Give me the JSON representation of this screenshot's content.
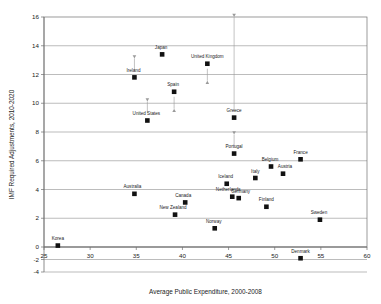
{
  "chart_data": {
    "type": "scatter",
    "title": "",
    "xlabel": "Average Public Expenditure, 2000-2008",
    "ylabel": "IMF Required Adjustments, 2010-2020",
    "xlim": [
      25,
      60
    ],
    "ylim": [
      -4,
      16
    ],
    "xticks": [
      25,
      30,
      35,
      40,
      45,
      50,
      55,
      60
    ],
    "yticks": [
      -4,
      -2,
      0,
      2,
      4,
      6,
      8,
      10,
      12,
      14,
      16
    ],
    "xtick_labels": [
      "25",
      "30",
      "35",
      "40",
      "45",
      "50",
      "55",
      "60"
    ],
    "ytick_labels": [
      "-4",
      "-2",
      "0",
      "2",
      "4",
      "6",
      "8",
      "10",
      "12",
      "14",
      "16"
    ],
    "grid": "horizontal",
    "legend": "none",
    "points": [
      {
        "name": "Korea",
        "x": 26.5,
        "y": 0.1,
        "label_dx": 0,
        "label_dy": -4,
        "arrow": "none"
      },
      {
        "name": "Australia",
        "x": 34.8,
        "y": 3.7,
        "label_dx": -2,
        "label_dy": -4,
        "arrow": "none"
      },
      {
        "name": "Ireland",
        "x": 34.8,
        "y": 11.8,
        "label_dx": -1,
        "label_dy": -4,
        "arrow": "up"
      },
      {
        "name": "United States",
        "x": 36.2,
        "y": 8.8,
        "label_dx": -1,
        "label_dy": -4,
        "arrow": "up"
      },
      {
        "name": "Japan",
        "x": 37.8,
        "y": 13.4,
        "label_dx": -1,
        "label_dy": -4,
        "arrow": "none"
      },
      {
        "name": "Spain",
        "x": 39.1,
        "y": 10.8,
        "label_dx": -1,
        "label_dy": -4,
        "arrow": "down"
      },
      {
        "name": "New Zealand",
        "x": 39.2,
        "y": 2.25,
        "label_dx": -2,
        "label_dy": -4,
        "arrow": "none"
      },
      {
        "name": "Canada",
        "x": 40.3,
        "y": 3.1,
        "label_dx": -2,
        "label_dy": -4,
        "arrow": "none"
      },
      {
        "name": "United Kingdom",
        "x": 42.7,
        "y": 12.75,
        "label_dx": 0,
        "label_dy": -4,
        "arrow": "down"
      },
      {
        "name": "Norway",
        "x": 43.5,
        "y": 1.3,
        "label_dx": -1,
        "label_dy": -4,
        "arrow": "none"
      },
      {
        "name": "Iceland",
        "x": 44.8,
        "y": 4.4,
        "label_dx": -1,
        "label_dy": -4,
        "arrow": "none"
      },
      {
        "name": "Netherlands",
        "x": 45.4,
        "y": 3.5,
        "label_dx": -4,
        "label_dy": -4,
        "arrow": "none"
      },
      {
        "name": "Greece",
        "x": 45.6,
        "y": 9.0,
        "label_dx": 0,
        "label_dy": -4,
        "arrow": "up-long"
      },
      {
        "name": "Portugal",
        "x": 45.6,
        "y": 6.5,
        "label_dx": 0,
        "label_dy": -4,
        "arrow": "up"
      },
      {
        "name": "Germany",
        "x": 46.1,
        "y": 3.4,
        "label_dx": 2,
        "label_dy": -4,
        "arrow": "none"
      },
      {
        "name": "Italy",
        "x": 47.9,
        "y": 4.8,
        "label_dx": 0,
        "label_dy": -4,
        "arrow": "none"
      },
      {
        "name": "Finland",
        "x": 49.1,
        "y": 2.8,
        "label_dx": 0,
        "label_dy": -4,
        "arrow": "none"
      },
      {
        "name": "Belgium",
        "x": 49.6,
        "y": 5.6,
        "label_dx": -1,
        "label_dy": -4,
        "arrow": "none"
      },
      {
        "name": "Austria",
        "x": 50.9,
        "y": 5.1,
        "label_dx": 2,
        "label_dy": -4,
        "arrow": "none"
      },
      {
        "name": "France",
        "x": 52.8,
        "y": 6.1,
        "label_dx": 0,
        "label_dy": -4,
        "arrow": "none"
      },
      {
        "name": "Denmark",
        "x": 52.8,
        "y": -1.8,
        "label_dx": 0,
        "label_dy": -4,
        "arrow": "none"
      },
      {
        "name": "Sweden",
        "x": 54.9,
        "y": 1.9,
        "label_dx": -1,
        "label_dy": -4,
        "arrow": "none"
      }
    ],
    "colors": {
      "marker": "#111111",
      "grid": "#8e8e8e",
      "frame": "#6f6f6f",
      "arrow": "#9a9a9a",
      "text": "#222222",
      "background": "#ffffff"
    }
  }
}
